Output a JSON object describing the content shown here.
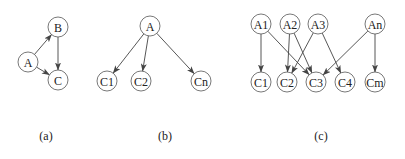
{
  "colors": {
    "stroke": "#444444",
    "node_fill": "#ffffff",
    "text": "#222222"
  },
  "node_radius": 10,
  "panels": [
    {
      "id": "a",
      "caption": "(a)",
      "caption_pos": [
        46,
        136
      ],
      "nodes": [
        {
          "id": "B",
          "label": "B",
          "x": 58,
          "y": 27
        },
        {
          "id": "A",
          "label": "A",
          "x": 28,
          "y": 62
        },
        {
          "id": "C",
          "label": "C",
          "x": 58,
          "y": 80
        }
      ],
      "edges": [
        {
          "from": "A",
          "to": "B"
        },
        {
          "from": "B",
          "to": "C"
        },
        {
          "from": "A",
          "to": "C"
        }
      ]
    },
    {
      "id": "b",
      "caption": "(b)",
      "caption_pos": [
        165,
        136
      ],
      "nodes": [
        {
          "id": "A",
          "label": "A",
          "x": 150,
          "y": 26
        },
        {
          "id": "C1",
          "label": "C1",
          "x": 107,
          "y": 81
        },
        {
          "id": "C2",
          "label": "C2",
          "x": 141,
          "y": 81
        },
        {
          "id": "Cn",
          "label": "Cn",
          "x": 201,
          "y": 81
        }
      ],
      "edges": [
        {
          "from": "A",
          "to": "C1"
        },
        {
          "from": "A",
          "to": "C2"
        },
        {
          "from": "A",
          "to": "Cn"
        }
      ]
    },
    {
      "id": "c",
      "caption": "(c)",
      "caption_pos": [
        321,
        136
      ],
      "nodes": [
        {
          "id": "A1",
          "label": "A1",
          "x": 261,
          "y": 24
        },
        {
          "id": "A2",
          "label": "A2",
          "x": 290,
          "y": 24
        },
        {
          "id": "A3",
          "label": "A3",
          "x": 318,
          "y": 24
        },
        {
          "id": "An",
          "label": "An",
          "x": 375,
          "y": 24
        },
        {
          "id": "C1",
          "label": "C1",
          "x": 261,
          "y": 82
        },
        {
          "id": "C2",
          "label": "C2",
          "x": 287,
          "y": 82
        },
        {
          "id": "C3",
          "label": "C3",
          "x": 316,
          "y": 82
        },
        {
          "id": "C4",
          "label": "C4",
          "x": 345,
          "y": 82
        },
        {
          "id": "Cm",
          "label": "Cm",
          "x": 375,
          "y": 82
        }
      ],
      "edges": [
        {
          "from": "A1",
          "to": "C1"
        },
        {
          "from": "A1",
          "to": "C3"
        },
        {
          "from": "A2",
          "to": "C2"
        },
        {
          "from": "A2",
          "to": "C3"
        },
        {
          "from": "A3",
          "to": "C2"
        },
        {
          "from": "A3",
          "to": "C4"
        },
        {
          "from": "An",
          "to": "C3"
        },
        {
          "from": "An",
          "to": "Cm"
        }
      ]
    }
  ]
}
